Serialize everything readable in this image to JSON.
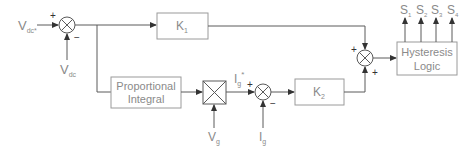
{
  "diagram": {
    "title": "",
    "inputs": {
      "vdc_ref": {
        "main": "V",
        "sub": "dc*"
      },
      "vdc": {
        "main": "V",
        "sub": "dc"
      },
      "vg": {
        "main": "V",
        "sub": "g"
      },
      "ig": {
        "main": "I",
        "sub": "g"
      },
      "ig_ref": {
        "main": "I",
        "sub": "g",
        "sup": "*"
      }
    },
    "blocks": {
      "k1": {
        "main": "K",
        "sub": "1"
      },
      "k2": {
        "main": "K",
        "sub": "2"
      },
      "pi": {
        "line1": "Proportional",
        "line2": "Integral"
      },
      "hysteresis": {
        "line1": "Hysteresis",
        "line2": "Logic"
      }
    },
    "outputs": [
      {
        "main": "S",
        "sub": "1"
      },
      {
        "main": "S",
        "sub": "2"
      },
      {
        "main": "S",
        "sub": "3"
      },
      {
        "main": "S",
        "sub": "4"
      }
    ],
    "signs": {
      "sum1_top": "+",
      "sum1_bottom": "−",
      "sum2_left": "+",
      "sum2_bottom": "+",
      "sum3_left": "+",
      "sum3_bottom": "−"
    },
    "colors": {
      "wire": "#5a5a5a",
      "block_border": "#9a9a9a",
      "text": "#8a8a8a"
    }
  }
}
